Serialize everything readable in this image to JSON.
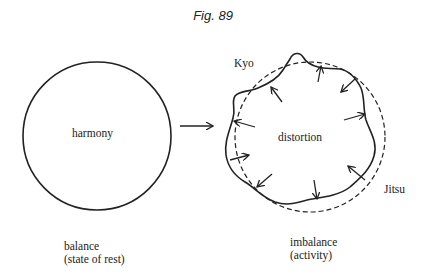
{
  "figure": {
    "title": "Fig. 89"
  },
  "left": {
    "center_label": "harmony",
    "caption_line1": "balance",
    "caption_line2": "(state of rest)"
  },
  "right": {
    "center_label": "distortion",
    "kyo_label": "Kyo",
    "jitsu_label": "Jitsu",
    "caption_line1": "imbalance",
    "caption_line2": "(activity)"
  }
}
